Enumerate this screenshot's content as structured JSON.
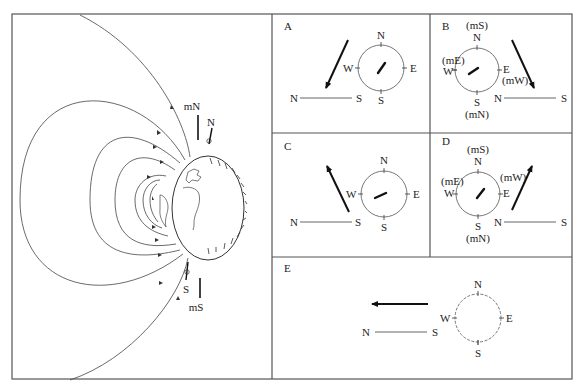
{
  "figure": {
    "type": "geomagnetic field and compass orientation diagram",
    "colors": {
      "line": "#444444",
      "frame": "#555555",
      "background": "#ffffff",
      "text": "#222222"
    }
  },
  "main_panel": {
    "labels": {
      "magnetic_north": "mN",
      "geographic_north": "N",
      "geographic_south": "S",
      "magnetic_south": "mS"
    },
    "elements": [
      "earth-globe",
      "magnetic-field-lines",
      "surface-field-arrows"
    ]
  },
  "panels": [
    {
      "id": "A",
      "label": "A",
      "compass": {
        "north": "N",
        "south": "S",
        "east": "E",
        "west": "W"
      },
      "axis": {
        "left": "N",
        "right": "S"
      },
      "arrow_direction": "down-left",
      "needle_direction": "up-right"
    },
    {
      "id": "B",
      "label": "B",
      "compass": {
        "north": "N",
        "south": "S",
        "east": "E",
        "west": "W",
        "north_alt": "(mS)",
        "south_alt": "(mN)",
        "east_alt": "(mW)",
        "west_alt": "(mE)"
      },
      "axis": {
        "left": "N",
        "right": "S"
      },
      "arrow_direction": "down-right",
      "needle_direction": "down-left"
    },
    {
      "id": "C",
      "label": "C",
      "compass": {
        "north": "N",
        "south": "S",
        "east": "E",
        "west": "W"
      },
      "axis": {
        "left": "N",
        "right": "S"
      },
      "arrow_direction": "up-left",
      "needle_direction": "down-left"
    },
    {
      "id": "D",
      "label": "D",
      "compass": {
        "north": "N",
        "south": "S",
        "east": "E",
        "west": "W",
        "north_alt": "(mS)",
        "south_alt": "(mN)",
        "east_alt": "(mW)",
        "west_alt": "(mE)"
      },
      "axis": {
        "left": "N",
        "right": "S"
      },
      "arrow_direction": "up-right",
      "needle_direction": "up-right"
    },
    {
      "id": "E",
      "label": "E",
      "compass": {
        "north": "N",
        "south": "S",
        "east": "E",
        "west": "W"
      },
      "axis": {
        "left": "N",
        "right": "S"
      },
      "arrow_direction": "left",
      "needle_direction": "none"
    }
  ]
}
